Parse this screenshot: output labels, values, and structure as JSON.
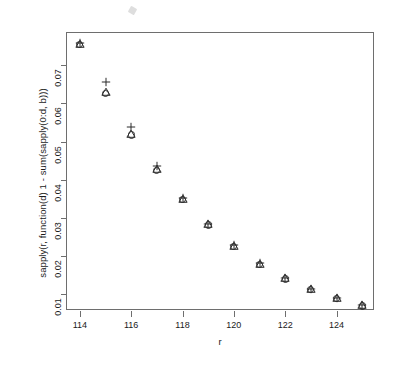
{
  "chart_data": {
    "type": "scatter",
    "title": "",
    "xlabel": "r",
    "ylabel": "sapply(r, function(d) 1 - sum(sapply(0:d, b)))",
    "x": [
      114,
      115,
      116,
      117,
      118,
      119,
      120,
      121,
      122,
      123,
      124,
      125
    ],
    "xlim": [
      113.5,
      125.5
    ],
    "ylim": [
      0.0055,
      0.0785
    ],
    "xticks": [
      114,
      116,
      118,
      120,
      122,
      124
    ],
    "xtick_labels": [
      "114",
      "116",
      "118",
      "120",
      "122",
      "124"
    ],
    "yticks": [
      0.01,
      0.02,
      0.03,
      0.04,
      0.05,
      0.06,
      0.07
    ],
    "ytick_labels": [
      "0.01",
      "0.02",
      "0.03",
      "0.04",
      "0.05",
      "0.06",
      "0.07"
    ],
    "grid": false,
    "legend": "none",
    "series": [
      {
        "name": "circle",
        "marker": "circle",
        "values": [
          0.0754,
          0.0626,
          0.0517,
          0.0425,
          0.0347,
          0.0281,
          0.0224,
          0.0177,
          0.0139,
          0.0111,
          0.0087,
          0.0068
        ]
      },
      {
        "name": "triangle",
        "marker": "triangle",
        "values": [
          0.0757,
          0.0629,
          0.0519,
          0.0427,
          0.0349,
          0.0283,
          0.0226,
          0.0179,
          0.0141,
          0.0113,
          0.0089,
          0.007
        ]
      },
      {
        "name": "plus",
        "marker": "plus",
        "values": [
          0.0758,
          0.0656,
          0.0538,
          0.0436,
          0.0352,
          0.0284,
          0.0227,
          0.018,
          0.0142,
          0.0113,
          0.0089,
          0.007
        ]
      }
    ]
  },
  "axes": {
    "x_title": "r",
    "y_title": "sapply(r, function(d) 1 - sum(sapply(0:d, b)))"
  }
}
